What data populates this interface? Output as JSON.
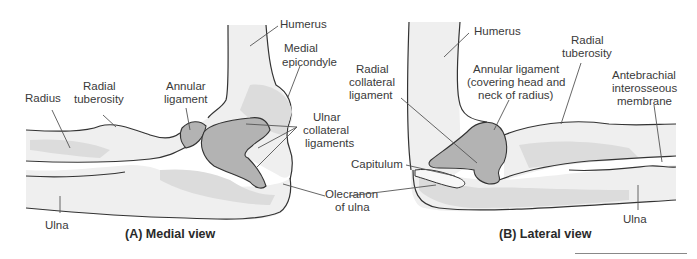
{
  "figure": {
    "colors": {
      "bone_fill": "#efefef",
      "bone_shade": "#dcdcdc",
      "ligament_fill": "#b3b3b3",
      "outline": "#333333",
      "leader": "#555555"
    },
    "panels": [
      {
        "caption": "(A) Medial view",
        "labels": {
          "humerus": "Humerus",
          "medial_epicondyle_1": "Medial",
          "medial_epicondyle_2": "epicondyle",
          "radius": "Radius",
          "radial_tuberosity_1": "Radial",
          "radial_tuberosity_2": "tuberosity",
          "annular_ligament_1": "Annular",
          "annular_ligament_2": "ligament",
          "ulnar_collateral_1": "Ulnar",
          "ulnar_collateral_2": "collateral",
          "ulnar_collateral_3": "ligaments",
          "olecranon_1": "Olecranon",
          "olecranon_2": "of ulna",
          "ulna": "Ulna"
        }
      },
      {
        "caption": "(B) Lateral view",
        "labels": {
          "humerus": "Humerus",
          "radial_collateral_1": "Radial",
          "radial_collateral_2": "collateral",
          "radial_collateral_3": "ligament",
          "annular_ligament_1": "Annular ligament",
          "annular_ligament_2": "(covering head and",
          "annular_ligament_3": "neck of radius)",
          "radial_tuberosity_1": "Radial",
          "radial_tuberosity_2": "tuberosity",
          "antebrachial_1": "Antebrachial",
          "antebrachial_2": "interosseous",
          "antebrachial_3": "membrane",
          "capitulum": "Capitulum",
          "ulna": "Ulna"
        }
      }
    ]
  }
}
